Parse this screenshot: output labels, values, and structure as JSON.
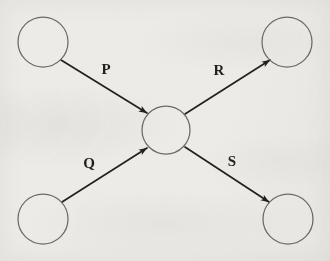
{
  "diagram": {
    "type": "directed-graph",
    "canvas": {
      "width": 330,
      "height": 261
    },
    "background_color": "#edebe7",
    "node_stroke_color": "#6f6a65",
    "edge_stroke_color": "#232120",
    "label_color": "#211f1e",
    "nodes": [
      {
        "id": "top-left",
        "label": "",
        "cx": 43,
        "cy": 42,
        "r": 25
      },
      {
        "id": "top-right",
        "label": "",
        "cx": 287,
        "cy": 42,
        "r": 25
      },
      {
        "id": "center",
        "label": "",
        "cx": 166,
        "cy": 130,
        "r": 24
      },
      {
        "id": "bottom-left",
        "label": "",
        "cx": 43,
        "cy": 219,
        "r": 25
      },
      {
        "id": "bottom-right",
        "label": "",
        "cx": 288,
        "cy": 219,
        "r": 25
      }
    ],
    "edges": [
      {
        "id": "edge-p",
        "label": "P",
        "from": "top-left",
        "to": "center",
        "direction": "into-center",
        "x1": 61,
        "y1": 60,
        "x2": 147,
        "y2": 113,
        "label_x": 106,
        "label_y": 71
      },
      {
        "id": "edge-r",
        "label": "R",
        "from": "center",
        "to": "top-right",
        "direction": "out-of-center",
        "x1": 185,
        "y1": 114,
        "x2": 270,
        "y2": 60,
        "label_x": 219,
        "label_y": 72
      },
      {
        "id": "edge-q",
        "label": "Q",
        "from": "bottom-left",
        "to": "center",
        "direction": "into-center",
        "x1": 62,
        "y1": 202,
        "x2": 147,
        "y2": 148,
        "label_x": 89,
        "label_y": 165
      },
      {
        "id": "edge-s",
        "label": "S",
        "from": "center",
        "to": "bottom-right",
        "direction": "out-of-center",
        "x1": 185,
        "y1": 147,
        "x2": 269,
        "y2": 202,
        "label_x": 232,
        "label_y": 163
      }
    ]
  }
}
